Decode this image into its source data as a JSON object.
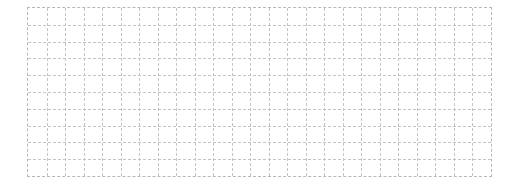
{
  "grid": {
    "columns": 25,
    "rows": 10,
    "line_color": "#c4c4c4",
    "line_style": "dashed",
    "background": "#ffffff"
  }
}
